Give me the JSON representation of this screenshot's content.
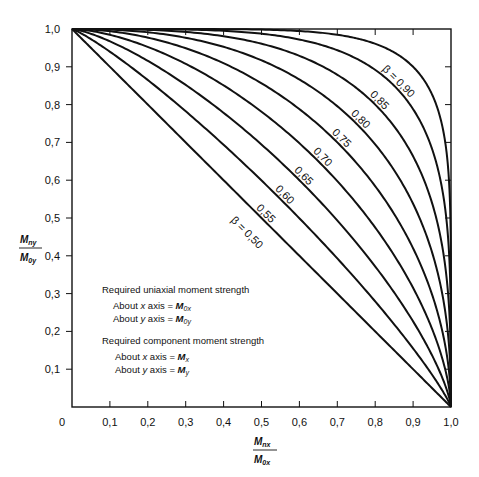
{
  "chart_data": {
    "type": "line",
    "title": "",
    "xlabel": "M_nx / M_0x",
    "ylabel": "M_ny / M_0y",
    "xlim": [
      0,
      1.0
    ],
    "ylim": [
      0,
      1.0
    ],
    "grid": false,
    "x_ticks": [
      "0",
      "0.1",
      "0.2",
      "0.3",
      "0.4",
      "0.5",
      "0.6",
      "0.7",
      "0.8",
      "0.9",
      "1.0"
    ],
    "y_ticks": [
      "0.1",
      "0.2",
      "0.3",
      "0.4",
      "0.5",
      "0.6",
      "0.7",
      "0.8",
      "0.9",
      "1.0"
    ],
    "equation": "(Mnx/M0x)^(log0.5/logβ) + (Mny/M0y)^(log0.5/logβ) = 1",
    "series": [
      {
        "name": "β = 0.50",
        "beta": 0.5,
        "label": "β = 0.50",
        "label_at": [
          0.5,
          0.5
        ],
        "points": [
          [
            0,
            1
          ],
          [
            0.25,
            0.75
          ],
          [
            0.5,
            0.5
          ],
          [
            0.75,
            0.25
          ],
          [
            1,
            0
          ]
        ]
      },
      {
        "name": "0.55",
        "beta": 0.55,
        "label": "0.55",
        "label_at": [
          0.55,
          0.55
        ],
        "points": [
          [
            0,
            1
          ],
          [
            0.25,
            0.82
          ],
          [
            0.55,
            0.55
          ],
          [
            0.82,
            0.25
          ],
          [
            1,
            0
          ]
        ]
      },
      {
        "name": "0.60",
        "beta": 0.6,
        "label": "0.60",
        "label_at": [
          0.6,
          0.6
        ],
        "points": [
          [
            0,
            1
          ],
          [
            0.25,
            0.87
          ],
          [
            0.6,
            0.6
          ],
          [
            0.87,
            0.25
          ],
          [
            1,
            0
          ]
        ]
      },
      {
        "name": "0.65",
        "beta": 0.65,
        "label": "0.65",
        "label_at": [
          0.65,
          0.65
        ],
        "points": [
          [
            0,
            1
          ],
          [
            0.25,
            0.91
          ],
          [
            0.65,
            0.65
          ],
          [
            0.91,
            0.25
          ],
          [
            1,
            0
          ]
        ]
      },
      {
        "name": "0.70",
        "beta": 0.7,
        "label": "0.70",
        "label_at": [
          0.7,
          0.7
        ],
        "points": [
          [
            0,
            1
          ],
          [
            0.25,
            0.94
          ],
          [
            0.7,
            0.7
          ],
          [
            0.94,
            0.25
          ],
          [
            1,
            0
          ]
        ]
      },
      {
        "name": "0.75",
        "beta": 0.75,
        "label": "0.75",
        "label_at": [
          0.75,
          0.75
        ],
        "points": [
          [
            0,
            1
          ],
          [
            0.25,
            0.96
          ],
          [
            0.75,
            0.75
          ],
          [
            0.96,
            0.25
          ],
          [
            1,
            0
          ]
        ]
      },
      {
        "name": "0.80",
        "beta": 0.8,
        "label": "0.80",
        "label_at": [
          0.8,
          0.8
        ],
        "points": [
          [
            0,
            1
          ],
          [
            0.25,
            0.98
          ],
          [
            0.8,
            0.8
          ],
          [
            0.98,
            0.25
          ],
          [
            1,
            0
          ]
        ]
      },
      {
        "name": "0.85",
        "beta": 0.85,
        "label": "0.85",
        "label_at": [
          0.85,
          0.85
        ],
        "points": [
          [
            0,
            1
          ],
          [
            0.25,
            0.99
          ],
          [
            0.85,
            0.85
          ],
          [
            0.99,
            0.25
          ],
          [
            1,
            0
          ]
        ]
      },
      {
        "name": "β = 0.90",
        "beta": 0.9,
        "label": "β = 0.90",
        "label_at": [
          0.9,
          0.9
        ],
        "points": [
          [
            0,
            1
          ],
          [
            0.25,
            1.0
          ],
          [
            0.9,
            0.9
          ],
          [
            1.0,
            0.25
          ],
          [
            1,
            0
          ]
        ]
      }
    ],
    "annotations": [
      "Required uniaxial moment strength",
      "About x axis = M0x",
      "About y axis = M0y",
      "Required component moment strength",
      "About x axis = Mx",
      "About y axis = My"
    ]
  },
  "axes": {
    "x_label_num": "M",
    "x_label_num_sub": "nx",
    "x_label_den": "M",
    "x_label_den_sub": "0x",
    "y_label_num": "M",
    "y_label_num_sub": "ny",
    "y_label_den": "M",
    "y_label_den_sub": "0y"
  },
  "legend": {
    "heading1": "Required uniaxial moment strength",
    "line1_prefix": "About ",
    "line1_var": "x",
    "line1_mid": " axis = ",
    "line1_M": "M",
    "line1_sub": "0x",
    "line2_prefix": "About ",
    "line2_var": "y",
    "line2_mid": " axis = ",
    "line2_M": "M",
    "line2_sub": "0y",
    "heading2": "Required component moment strength",
    "line3_prefix": "About ",
    "line3_var": "x",
    "line3_mid": " axis = ",
    "line3_M": "M",
    "line3_sub": "x",
    "line4_prefix": "About ",
    "line4_var": "y",
    "line4_mid": " axis = ",
    "line4_M": "M",
    "line4_sub": "y"
  }
}
